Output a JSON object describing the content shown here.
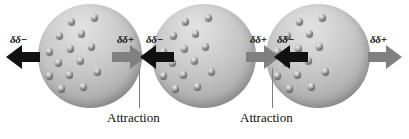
{
  "figure": {
    "background_color": "#ffffff",
    "width": 409,
    "height": 139
  },
  "colors": {
    "negative_arrow": "#111111",
    "positive_arrow": "#808080",
    "sphere_light": "#e2e2e2",
    "sphere_dark": "#8e8e8e",
    "leader_line": "#808080",
    "text": "#111111"
  },
  "atoms": [
    {
      "id": "atom-1",
      "name": "atom-left",
      "x": 38,
      "y": 4,
      "diameter": 104,
      "electron_count": 14,
      "electrons": [
        {
          "x": 30,
          "y": 14
        },
        {
          "x": 53,
          "y": 10
        },
        {
          "x": 18,
          "y": 28
        },
        {
          "x": 40,
          "y": 26
        },
        {
          "x": 8,
          "y": 44
        },
        {
          "x": 29,
          "y": 41
        },
        {
          "x": 50,
          "y": 39
        },
        {
          "x": 17,
          "y": 55
        },
        {
          "x": 39,
          "y": 53
        },
        {
          "x": 8,
          "y": 68
        },
        {
          "x": 28,
          "y": 67
        },
        {
          "x": 20,
          "y": 81
        },
        {
          "x": 42,
          "y": 79
        },
        {
          "x": 56,
          "y": 64
        }
      ]
    },
    {
      "id": "atom-2",
      "name": "atom-middle",
      "x": 152,
      "y": 4,
      "electron_count": 14,
      "electrons": [
        {
          "x": 30,
          "y": 14
        },
        {
          "x": 53,
          "y": 10
        },
        {
          "x": 18,
          "y": 28
        },
        {
          "x": 40,
          "y": 26
        },
        {
          "x": 8,
          "y": 44
        },
        {
          "x": 29,
          "y": 41
        },
        {
          "x": 50,
          "y": 39
        },
        {
          "x": 17,
          "y": 55
        },
        {
          "x": 39,
          "y": 53
        },
        {
          "x": 8,
          "y": 68
        },
        {
          "x": 28,
          "y": 67
        },
        {
          "x": 20,
          "y": 81
        },
        {
          "x": 42,
          "y": 79
        },
        {
          "x": 56,
          "y": 64
        }
      ]
    },
    {
      "id": "atom-3",
      "name": "atom-right",
      "x": 266,
      "y": 4,
      "electron_count": 14,
      "electrons": [
        {
          "x": 30,
          "y": 14
        },
        {
          "x": 53,
          "y": 10
        },
        {
          "x": 18,
          "y": 28
        },
        {
          "x": 40,
          "y": 26
        },
        {
          "x": 8,
          "y": 44
        },
        {
          "x": 29,
          "y": 41
        },
        {
          "x": 50,
          "y": 39
        },
        {
          "x": 17,
          "y": 55
        },
        {
          "x": 39,
          "y": 53
        },
        {
          "x": 8,
          "y": 68
        },
        {
          "x": 28,
          "y": 67
        },
        {
          "x": 20,
          "y": 81
        },
        {
          "x": 42,
          "y": 79
        },
        {
          "x": 56,
          "y": 64
        }
      ]
    }
  ],
  "arrows": [
    {
      "id": "arrow-1",
      "name": "dipole-arrow-negative-left",
      "direction": "left",
      "polarity": "negative",
      "x": 6,
      "y": 44
    },
    {
      "id": "arrow-2",
      "name": "dipole-arrow-positive-left",
      "direction": "right",
      "polarity": "positive",
      "x": 112,
      "y": 44
    },
    {
      "id": "arrow-3",
      "name": "dipole-arrow-negative-middle",
      "direction": "left",
      "polarity": "negative",
      "x": 140,
      "y": 44
    },
    {
      "id": "arrow-4",
      "name": "dipole-arrow-positive-middle",
      "direction": "right",
      "polarity": "positive",
      "x": 246,
      "y": 44
    },
    {
      "id": "arrow-5",
      "name": "dipole-arrow-negative-right",
      "direction": "left",
      "polarity": "negative",
      "x": 274,
      "y": 44
    },
    {
      "id": "arrow-6",
      "name": "dipole-arrow-positive-right",
      "direction": "right",
      "polarity": "positive",
      "x": 368,
      "y": 44
    }
  ],
  "charge_labels": [
    {
      "id": "label-1",
      "text": "δδ−",
      "x": 10,
      "y": 33
    },
    {
      "id": "label-2",
      "text": "δδ+",
      "x": 117,
      "y": 33
    },
    {
      "id": "label-3",
      "text": "δδ−",
      "x": 146,
      "y": 33
    },
    {
      "id": "label-4",
      "text": "δδ+",
      "x": 250,
      "y": 33
    },
    {
      "id": "label-5",
      "text": "δδ−",
      "x": 277,
      "y": 33
    },
    {
      "id": "label-6",
      "text": "δδ+",
      "x": 370,
      "y": 33
    }
  ],
  "annotations": [
    {
      "id": "attraction-1",
      "label": "Attraction",
      "leader": {
        "x": 139,
        "y": 68,
        "height": 40
      },
      "text_x": 107,
      "text_y": 110
    },
    {
      "id": "attraction-2",
      "label": "Attraction",
      "leader": {
        "x": 272,
        "y": 68,
        "height": 40
      },
      "text_x": 240,
      "text_y": 110
    }
  ]
}
